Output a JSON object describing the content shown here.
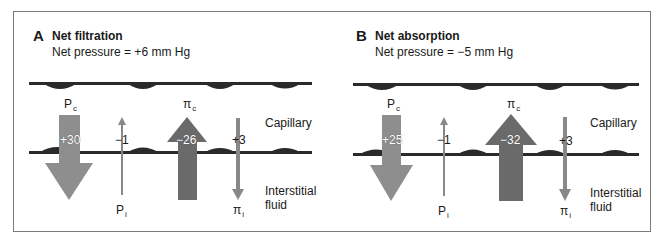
{
  "colors": {
    "frame": "#7a7a7a",
    "membrane": "#2a2a2a",
    "light_arrow": "#8e8e8e",
    "dark_arrow": "#6a6a6a",
    "thin_arrow": "#888888"
  },
  "labels": {
    "capillary": "Capillary",
    "interstitial_line1": "Interstitial",
    "interstitial_line2": "fluid"
  },
  "panels": [
    {
      "letter": "A",
      "title": "Net filtration",
      "subtitle": "Net pressure = +6 mm Hg",
      "forces": {
        "Pc": {
          "symbol": "P",
          "sub": "c",
          "value": "+30",
          "direction": "out"
        },
        "Pi": {
          "symbol": "P",
          "sub": "i",
          "value": "−1",
          "direction": "in"
        },
        "pic": {
          "symbol": "π",
          "sub": "c",
          "value": "−26",
          "direction": "in"
        },
        "pii": {
          "symbol": "π",
          "sub": "i",
          "value": "+3",
          "direction": "out"
        }
      }
    },
    {
      "letter": "B",
      "title": "Net absorption",
      "subtitle": "Net pressure = −5 mm Hg",
      "forces": {
        "Pc": {
          "symbol": "P",
          "sub": "c",
          "value": "+25",
          "direction": "out"
        },
        "Pi": {
          "symbol": "P",
          "sub": "i",
          "value": "−1",
          "direction": "in"
        },
        "pic": {
          "symbol": "π",
          "sub": "c",
          "value": "−32",
          "direction": "in"
        },
        "pii": {
          "symbol": "π",
          "sub": "i",
          "value": "+3",
          "direction": "out"
        }
      }
    }
  ]
}
